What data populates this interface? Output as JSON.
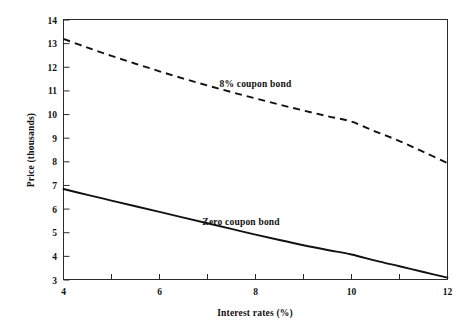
{
  "chart_data": {
    "type": "line",
    "title": "",
    "xlabel": "Interest rates (%)",
    "ylabel": "Price (thousands)",
    "xlim": [
      4,
      12
    ],
    "ylim": [
      3,
      14
    ],
    "xticks": [
      4,
      5,
      6,
      7,
      8,
      9,
      10,
      11,
      12
    ],
    "xtick_labels": [
      "4",
      "",
      "6",
      "",
      "8",
      "",
      "10",
      "",
      "12"
    ],
    "yticks": [
      3,
      4,
      5,
      6,
      7,
      8,
      9,
      10,
      11,
      12,
      13,
      14
    ],
    "ytick_labels": [
      "3",
      "4",
      "5",
      "6",
      "7",
      "8",
      "9",
      "10",
      "11",
      "12",
      "13",
      "14"
    ],
    "grid": false,
    "legend_position": "inline-annotations",
    "x": [
      4,
      4.5,
      5,
      5.5,
      6,
      6.5,
      7,
      7.5,
      8,
      8.5,
      9,
      9.5,
      10,
      10.5,
      11,
      11.5,
      12
    ],
    "series": [
      {
        "name": "8% coupon bond",
        "style": "dashed",
        "values": [
          13.2,
          12.83,
          12.48,
          12.15,
          11.83,
          11.52,
          11.23,
          10.95,
          10.68,
          10.42,
          10.17,
          9.93,
          9.7,
          9.28,
          8.88,
          8.42,
          7.95
        ]
      },
      {
        "name": "Zero coupon bond",
        "style": "solid",
        "values": [
          6.85,
          6.6,
          6.36,
          6.12,
          5.88,
          5.64,
          5.4,
          5.16,
          4.92,
          4.69,
          4.47,
          4.27,
          4.08,
          3.82,
          3.58,
          3.34,
          3.1
        ]
      }
    ],
    "annotations": [
      {
        "text": "8% coupon bond",
        "x": 8.0,
        "y": 11.15
      },
      {
        "text": "Zero coupon bond",
        "x": 7.7,
        "y": 5.35
      }
    ]
  }
}
